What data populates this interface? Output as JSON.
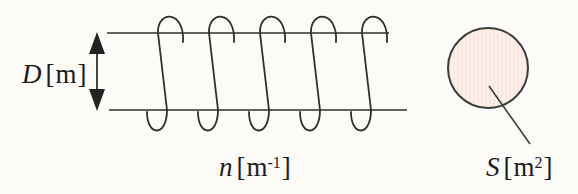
{
  "figure": {
    "type": "solenoid-diagram",
    "background_color": "#fcfbf8",
    "line_color": "#2f2f2f",
    "coil": {
      "turns_drawn": 5
    },
    "labels": {
      "diameter": {
        "variable": "D",
        "bracket_open": "[",
        "unit": "m",
        "bracket_close": "]"
      },
      "winding_density": {
        "variable": "n",
        "bracket_open": "[",
        "unit": "m",
        "superscript": "-1",
        "bracket_close": "]"
      },
      "cross_section": {
        "variable": "S",
        "bracket_open": "[",
        "unit": "m",
        "superscript": "2",
        "bracket_close": "]"
      }
    },
    "cross_section_circle": {
      "fill_color": "#fbe7df",
      "stripe_color": "#fdf1ea",
      "border_color": "#3c3c3c"
    }
  }
}
